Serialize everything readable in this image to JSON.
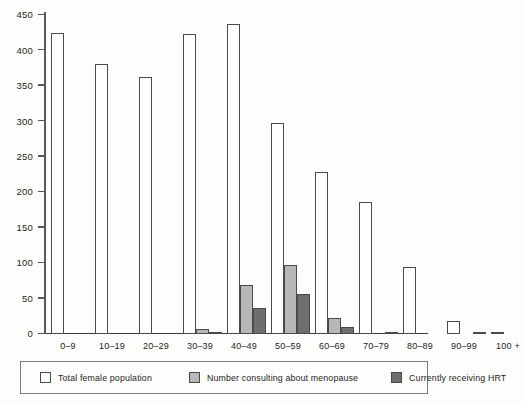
{
  "chart_data": {
    "type": "bar",
    "title": "",
    "subtitle": "",
    "xlabel": "",
    "ylabel": "",
    "ylim": [
      0,
      450
    ],
    "yticks": [
      0,
      50,
      100,
      150,
      200,
      250,
      300,
      350,
      400,
      450
    ],
    "grid": false,
    "legend_position": "bottom",
    "categories": [
      "0–9",
      "10–19",
      "20–29",
      "30–39",
      "40–49",
      "50–59",
      "60–69",
      "70–79",
      "80–89",
      "90–99",
      "100 +"
    ],
    "series": [
      {
        "name": "Total female population",
        "color": "#ffffff",
        "values": [
          424,
          381,
          363,
          423,
          438,
          297,
          228,
          186,
          95,
          18,
          2
        ]
      },
      {
        "name": "Number consulting about menopause",
        "color": "#b7b7b7",
        "values": [
          0,
          0,
          0,
          7,
          69,
          97,
          22,
          0,
          0,
          0,
          0
        ]
      },
      {
        "name": "Currently receiving HRT",
        "color": "#6e6e6e",
        "values": [
          0,
          0,
          0,
          2,
          37,
          56,
          10,
          3,
          0,
          1,
          0
        ]
      }
    ]
  },
  "legend": {
    "items": [
      {
        "label": "Total female population",
        "swatch": "white-square-swatch"
      },
      {
        "label": "Number consulting about menopause",
        "swatch": "light-gray-square-swatch"
      },
      {
        "label": "Currently receiving HRT",
        "swatch": "dark-gray-square-swatch"
      }
    ]
  },
  "colors": {
    "series_total": "#ffffff",
    "series_consulting": "#b7b7b7",
    "series_hrt": "#6e6e6e",
    "axis": "#58585a",
    "background": "#fdfdfb",
    "text": "#1d1d1d"
  }
}
